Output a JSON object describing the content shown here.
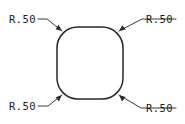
{
  "drawing": {
    "type": "engineering-drawing",
    "title": "Rounded square fillet radius callouts",
    "background_color": "#ffffff",
    "line_color": "#272727",
    "text_color": "#1a1a1a",
    "shape": {
      "name": "rounded-square",
      "x": 57,
      "y": 27,
      "width": 66,
      "height": 72,
      "corner_radius": 21
    },
    "callouts": [
      {
        "id": "top-left",
        "label": "R.50",
        "text_x": 9,
        "text_y": 23,
        "leader_path": "M 38 19 L 47 19 L 62 31",
        "arrow_points": "62,31 55.5,29.2 58.6,24.8",
        "target_corner": "top-left-fillet"
      },
      {
        "id": "top-right",
        "label": "R.50",
        "text_x": 146,
        "text_y": 23,
        "leader_path": "M 176 19 L 142 19 L 119 31",
        "arrow_points": "119,31 125.7,29.6 122.3,25.2",
        "target_corner": "top-right-fillet"
      },
      {
        "id": "bottom-left",
        "label": "R.50",
        "text_x": 9,
        "text_y": 110,
        "leader_path": "M 38 106 L 48 106 L 62 95",
        "arrow_points": "62,95 55.6,97.2 58.9,101.4",
        "target_corner": "bottom-left-fillet"
      },
      {
        "id": "bottom-right",
        "label": "R.50",
        "text_x": 146,
        "text_y": 112,
        "leader_path": "M 176 108 L 141 108 L 119 95",
        "arrow_points": "119,95 125.6,97.0 122.0,101.4",
        "target_corner": "bottom-right-fillet"
      }
    ]
  }
}
